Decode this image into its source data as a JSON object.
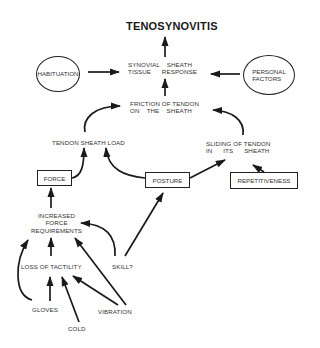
{
  "diagram": {
    "title": "TENOSYNOVITIS",
    "nodes": {
      "synovial_response": "SYNOVIAL    SHEATH\nTISSUE      RESPONSE",
      "habituation": "HABITUATION",
      "personal_factors": "PERSONAL\nFACTORS",
      "friction": "FRICTION OF TENDON\nON    THE    SHEATH",
      "tendon_sheath_load": "TENDON SHEATH LOAD",
      "sliding": "SLIDING OF TENDON\nIN      ITS      SHEATH",
      "force": "FORCE",
      "posture": "POSTURE",
      "repetitiveness": "REPETITIVENESS",
      "increased_force": "INCREASED\nFORCE\nREQUIREMENTS",
      "loss_of_tactility": "LOSS OF TACTILITY",
      "skill": "SKILL?",
      "gloves": "GLOVES",
      "vibration": "VIBRATION",
      "cold": "COLD"
    },
    "edges": [
      {
        "from": "synovial_response",
        "to": "title"
      },
      {
        "from": "habituation",
        "to": "synovial_response"
      },
      {
        "from": "personal_factors",
        "to": "synovial_response"
      },
      {
        "from": "friction",
        "to": "synovial_response"
      },
      {
        "from": "tendon_sheath_load",
        "to": "friction"
      },
      {
        "from": "sliding",
        "to": "friction"
      },
      {
        "from": "force",
        "to": "tendon_sheath_load"
      },
      {
        "from": "posture",
        "to": "tendon_sheath_load"
      },
      {
        "from": "posture",
        "to": "sliding"
      },
      {
        "from": "repetitiveness",
        "to": "sliding"
      },
      {
        "from": "increased_force",
        "to": "force"
      },
      {
        "from": "skill",
        "to": "posture"
      },
      {
        "from": "skill",
        "to": "increased_force"
      },
      {
        "from": "loss_of_tactility",
        "to": "increased_force"
      },
      {
        "from": "gloves",
        "to": "increased_force"
      },
      {
        "from": "gloves",
        "to": "loss_of_tactility"
      },
      {
        "from": "cold",
        "to": "loss_of_tactility"
      },
      {
        "from": "vibration",
        "to": "loss_of_tactility"
      },
      {
        "from": "vibration",
        "to": "increased_force"
      }
    ]
  }
}
